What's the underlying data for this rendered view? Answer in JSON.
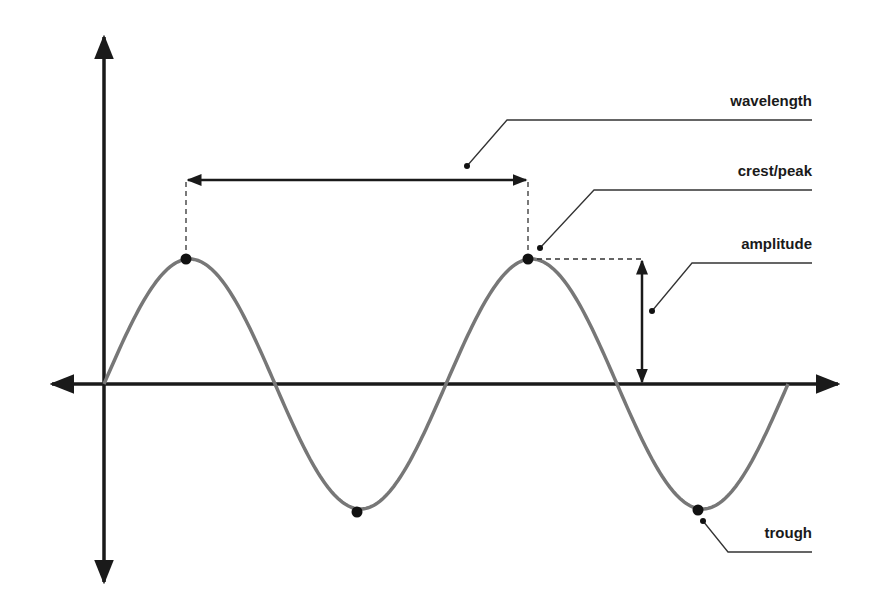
{
  "diagram": {
    "labels": {
      "wavelength": "wavelength",
      "crest": "crest/peak",
      "amplitude": "amplitude",
      "trough": "trough"
    },
    "colors": {
      "axis": "#1a1a1a",
      "wave": "#777777",
      "point": "#111111",
      "leader": "#333333",
      "dashed": "#333333"
    },
    "axes": {
      "origin": [
        104,
        384
      ],
      "x_axis": {
        "from": 50,
        "to": 840,
        "arrows": "both"
      },
      "y_axis": {
        "from": 35,
        "to": 582,
        "arrows": "both"
      }
    },
    "wave": {
      "type": "sine",
      "cycles": 2,
      "start_x": 104,
      "period_px": 342,
      "amplitude_px": 125,
      "baseline_y": 384
    },
    "points": [
      {
        "name": "crest-1",
        "x": 186,
        "y": 259
      },
      {
        "name": "trough-1",
        "x": 357,
        "y": 512
      },
      {
        "name": "crest-2",
        "x": 528,
        "y": 259
      },
      {
        "name": "trough-2",
        "x": 698,
        "y": 510
      }
    ]
  }
}
